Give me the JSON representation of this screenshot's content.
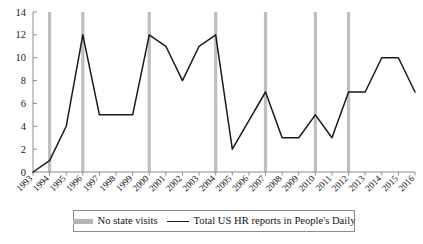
{
  "chart_data": {
    "type": "line",
    "title": "",
    "xlabel": "",
    "ylabel": "",
    "ylim": [
      0,
      14
    ],
    "ytick_step": 2,
    "yticks": [
      "0",
      "2",
      "4",
      "6",
      "8",
      "10",
      "12",
      "14"
    ],
    "grid": false,
    "legend_position": "bottom",
    "categories": [
      "1993",
      "1994",
      "1995",
      "1996",
      "1997",
      "1998",
      "1999",
      "2000",
      "2001",
      "2002",
      "2003",
      "2004",
      "2005",
      "2006",
      "2007",
      "2008",
      "2009",
      "2010",
      "2011",
      "2012",
      "2013",
      "2014",
      "2015",
      "2016"
    ],
    "series": [
      {
        "name": "Total US HR reports in People's Daily",
        "color": "#1a1a1a",
        "values": [
          0,
          1,
          4,
          12,
          5,
          5,
          5,
          12,
          11,
          8,
          11,
          12,
          2,
          4.5,
          7,
          3,
          3,
          5,
          3,
          7,
          7,
          10,
          10,
          7
        ]
      }
    ],
    "vertical_markers": {
      "name": "No state visits",
      "color": "#bfbfbf",
      "years": [
        "1994",
        "1996",
        "2000",
        "2004",
        "2007",
        "2010",
        "2012"
      ]
    }
  },
  "legend": {
    "entries": [
      {
        "label": "No state visits",
        "marker": "bar-swatch",
        "color": "#b4b4b4"
      },
      {
        "label": "Total US HR reports in People's Daily",
        "marker": "line-swatch",
        "color": "#1a1a1a"
      }
    ]
  },
  "axes": {
    "axis_color": "#8c8c8c"
  }
}
